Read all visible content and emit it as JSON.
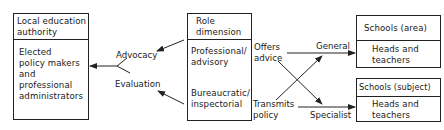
{
  "diagram": {
    "type": "flow",
    "lea_box": {
      "title": "Local education\nauthority",
      "body": "Elected\npolicy makers\nand\nprofessional\nadministrators"
    },
    "role_box": {
      "title": "Role\ndimension",
      "upper": "Professional/\nadvisory",
      "lower": "Bureaucratic/\ninspectorial"
    },
    "schools_area_box": {
      "title": "Schools (area)",
      "body": "Heads and\nteachers"
    },
    "schools_subject_box": {
      "title": "Schools (subject)",
      "body": "Heads and\nteachers"
    },
    "labels": {
      "advocacy": "Advocacy",
      "evaluation": "Evaluation",
      "offers_advice": "Offers\nadvice",
      "transmits_policy": "Transmits\npolicy",
      "general": "General",
      "specialist": "Specialist"
    },
    "edges": [
      {
        "from": "role_box.upper",
        "to": "advocacy",
        "label": "Advocacy"
      },
      {
        "from": "role_box.lower",
        "to": "evaluation",
        "label": "Evaluation"
      },
      {
        "from": "advocacy+evaluation",
        "to": "lea_box"
      },
      {
        "from": "offers_advice",
        "to": "schools_area_box",
        "label": "General"
      },
      {
        "from": "offers_advice",
        "to": "schools_subject_box",
        "label": "Specialist"
      },
      {
        "from": "transmits_policy",
        "to": "schools_subject_box",
        "label": "Specialist"
      },
      {
        "from": "transmits_policy",
        "to": "schools_area_box",
        "label": "General"
      }
    ]
  }
}
